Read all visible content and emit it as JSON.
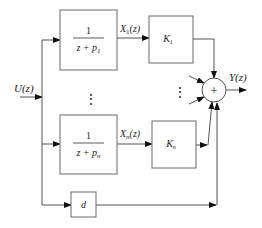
{
  "diagram": {
    "type": "block-diagram",
    "input": {
      "label": "U(z)"
    },
    "output": {
      "label": "Y(z)"
    },
    "branches": [
      {
        "filter": {
          "numerator": "1",
          "denominator_prefix": "z + p",
          "denominator_sub": "1"
        },
        "signal": {
          "prefix": "X",
          "sub": "1",
          "suffix": "(z)"
        },
        "gain": {
          "prefix": "K",
          "sub": "1"
        }
      },
      {
        "filter": {
          "numerator": "1",
          "denominator_prefix": "z + p",
          "denominator_sub": "n"
        },
        "signal": {
          "prefix": "X",
          "sub": "n",
          "suffix": "(z)"
        },
        "gain": {
          "prefix": "K",
          "sub": "n"
        }
      }
    ],
    "feedthrough": {
      "label": "d"
    },
    "summer": {
      "symbol": "+"
    },
    "ellipsis": "⋮",
    "colors": {
      "line": "#555555",
      "box_border": "#6a6a6a",
      "text": "#222222",
      "background": "#ffffff"
    }
  }
}
